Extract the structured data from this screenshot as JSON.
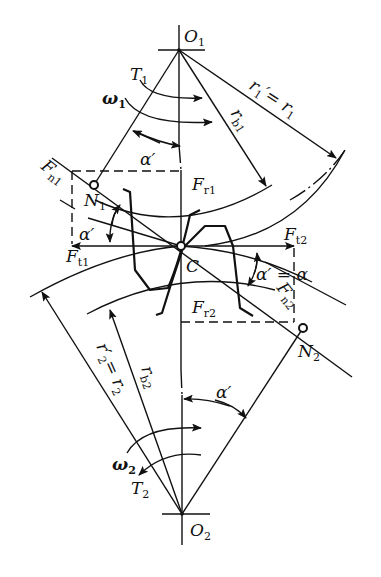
{
  "diagram": {
    "points": {
      "O1": {
        "label": "O",
        "sub": "1"
      },
      "O2": {
        "label": "O",
        "sub": "2"
      },
      "C": {
        "label": "C"
      },
      "N1": {
        "label": "N",
        "sub": "1"
      },
      "N2": {
        "label": "N",
        "sub": "2"
      }
    },
    "labels": {
      "T1": {
        "label": "T",
        "sub": "1"
      },
      "T2": {
        "label": "T",
        "sub": "2"
      },
      "omega1": {
        "label": "ω",
        "sub": "1"
      },
      "omega2": {
        "label": "ω",
        "sub": "2"
      },
      "alpha_top": {
        "label": "α′"
      },
      "alpha_left": {
        "label": "α′"
      },
      "alpha_right": {
        "label": "α′ = α"
      },
      "alpha_bottom": {
        "label": "α′"
      },
      "r1": {
        "label": "r",
        "sub": "1",
        "eq": "′= r",
        "sub2": "1"
      },
      "rb1": {
        "label": "r",
        "sub": "b1"
      },
      "r2": {
        "label": "r′",
        "sub": "2",
        "eq": "= r",
        "sub2": "2"
      },
      "rb2": {
        "label": "r",
        "sub": "b2"
      },
      "Fn1": {
        "label": "F",
        "sub": "n1"
      },
      "Fn2": {
        "label": "F",
        "sub": "n2"
      },
      "Fr1": {
        "label": "F",
        "sub": "r1"
      },
      "Fr2": {
        "label": "F",
        "sub": "r2"
      },
      "Ft1": {
        "label": "F",
        "sub": "t1"
      },
      "Ft2": {
        "label": "F",
        "sub": "t2"
      }
    },
    "colors": {
      "stroke": "#111111",
      "background": "#ffffff"
    }
  }
}
